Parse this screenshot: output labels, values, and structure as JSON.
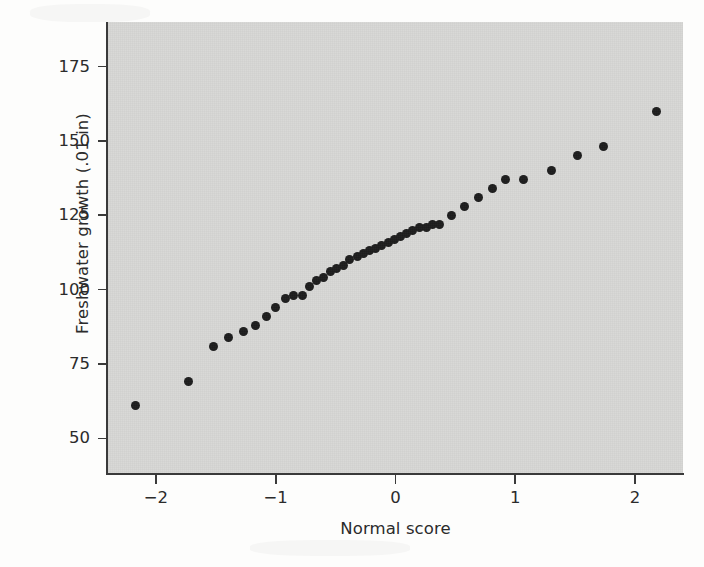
{
  "chart_data": {
    "type": "scatter",
    "title": "",
    "xlabel": "Normal score",
    "ylabel": "Freshwater growth (.01 in)",
    "xlim": [
      -2.4,
      2.4
    ],
    "ylim": [
      38,
      190
    ],
    "xticks": [
      -2,
      -1,
      0,
      1,
      2
    ],
    "xticklabels": [
      "−2",
      "−1",
      "0",
      "1",
      "2"
    ],
    "yticks": [
      50,
      75,
      100,
      125,
      150,
      175
    ],
    "yticklabels": [
      "50",
      "75",
      "100",
      "125",
      "150",
      "175"
    ],
    "grid": false,
    "legend": null,
    "marker": "filled-circle",
    "marker_color": "#1d1d1d",
    "panel_color": "#d7d7d5",
    "axis_color": "#3a3a3a",
    "n_points": 40,
    "x": [
      -2.17,
      -1.73,
      -1.51,
      -1.38,
      -1.28,
      -1.19,
      -1.11,
      -1.03,
      -0.96,
      -0.89,
      -0.82,
      -0.76,
      -0.7,
      -0.64,
      -0.58,
      -0.52,
      -0.46,
      -0.4,
      -0.34,
      -0.29,
      -0.23,
      -0.17,
      -0.12,
      -0.06,
      -0.01,
      0.05,
      0.11,
      0.17,
      0.23,
      0.29,
      0.36,
      0.43,
      0.5,
      0.58,
      0.66,
      0.76,
      0.86,
      1.07,
      1.4,
      1.73,
      2.17
    ],
    "y": [
      61,
      69,
      81,
      84,
      86,
      88,
      91,
      94,
      96,
      98,
      98,
      101,
      103,
      104,
      106,
      107,
      108,
      110,
      111,
      112,
      113,
      114,
      115,
      116,
      117,
      118,
      119,
      120,
      121,
      121,
      122,
      122,
      124,
      127,
      129,
      131,
      134,
      137,
      140,
      145,
      148,
      160
    ],
    "points": [
      {
        "x": -2.17,
        "y": 61
      },
      {
        "x": -1.73,
        "y": 69
      },
      {
        "x": -1.52,
        "y": 81
      },
      {
        "x": -1.39,
        "y": 84
      },
      {
        "x": -1.27,
        "y": 86
      },
      {
        "x": -1.17,
        "y": 88
      },
      {
        "x": -1.08,
        "y": 91
      },
      {
        "x": -1.0,
        "y": 94
      },
      {
        "x": -0.92,
        "y": 97
      },
      {
        "x": -0.85,
        "y": 98
      },
      {
        "x": -0.78,
        "y": 98
      },
      {
        "x": -0.72,
        "y": 101
      },
      {
        "x": -0.66,
        "y": 103
      },
      {
        "x": -0.6,
        "y": 104
      },
      {
        "x": -0.54,
        "y": 106
      },
      {
        "x": -0.49,
        "y": 107
      },
      {
        "x": -0.43,
        "y": 108
      },
      {
        "x": -0.38,
        "y": 110
      },
      {
        "x": -0.32,
        "y": 111
      },
      {
        "x": -0.27,
        "y": 112
      },
      {
        "x": -0.22,
        "y": 113
      },
      {
        "x": -0.17,
        "y": 114
      },
      {
        "x": -0.12,
        "y": 115
      },
      {
        "x": -0.06,
        "y": 116
      },
      {
        "x": -0.01,
        "y": 117
      },
      {
        "x": 0.04,
        "y": 118
      },
      {
        "x": 0.09,
        "y": 119
      },
      {
        "x": 0.14,
        "y": 120
      },
      {
        "x": 0.2,
        "y": 121
      },
      {
        "x": 0.26,
        "y": 121
      },
      {
        "x": 0.31,
        "y": 122
      },
      {
        "x": 0.37,
        "y": 122
      },
      {
        "x": 0.47,
        "y": 125
      },
      {
        "x": 0.58,
        "y": 128
      },
      {
        "x": 0.69,
        "y": 131
      },
      {
        "x": 0.81,
        "y": 134
      },
      {
        "x": 0.92,
        "y": 137
      },
      {
        "x": 1.07,
        "y": 137
      },
      {
        "x": 1.3,
        "y": 140
      },
      {
        "x": 1.52,
        "y": 145
      },
      {
        "x": 1.74,
        "y": 148
      },
      {
        "x": 2.18,
        "y": 160
      }
    ]
  }
}
